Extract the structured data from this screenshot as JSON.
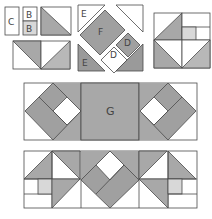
{
  "diagram": {
    "type": "quilt-block-assembly",
    "colors": {
      "dark": "#9a9a9a",
      "mid": "#a8a8a8",
      "light": "#d8d8d8",
      "white": "#ffffff",
      "line": "#4a4a4a"
    },
    "labels": {
      "c": "C",
      "b_top": "B",
      "b_bottom": "B",
      "e_top": "E",
      "f": "F",
      "d_right": "D",
      "d_lower": "D",
      "e_bottom": "E",
      "g": "G"
    },
    "steps": [
      {
        "id": "step-1",
        "description": "Piece C and two B squares; join half-square triangle units"
      },
      {
        "id": "step-2",
        "description": "Assemble center diamond from E, F and D pieces"
      },
      {
        "id": "step-3",
        "description": "Four-patch corner block with small square"
      },
      {
        "id": "step-4",
        "description": "Middle row: diamond blocks flanking G square"
      },
      {
        "id": "step-5",
        "description": "Bottom row: triangle units and diamond center"
      }
    ]
  }
}
